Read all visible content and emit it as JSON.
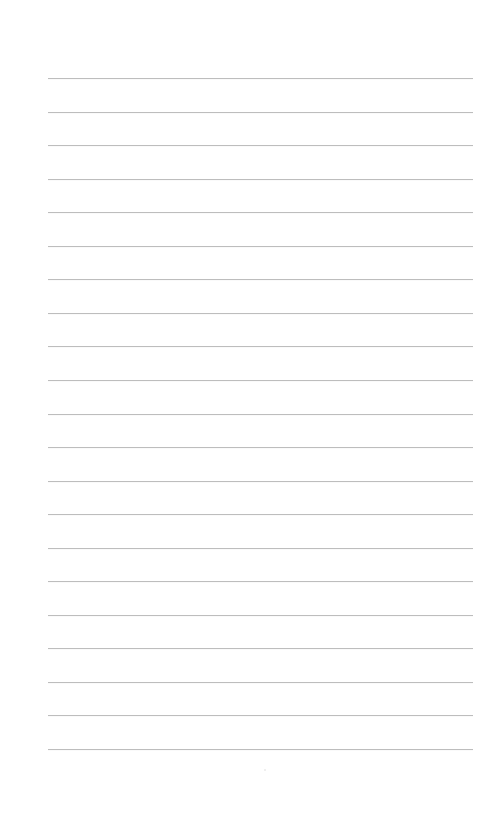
{
  "page": {
    "type": "ruled-paper",
    "background_color": "#ffffff",
    "rule_color": "#bdbdbd",
    "rule_count": 21,
    "first_rule_y": 78,
    "rule_spacing": 33.55,
    "rule_left": 48,
    "rule_right": 473
  }
}
